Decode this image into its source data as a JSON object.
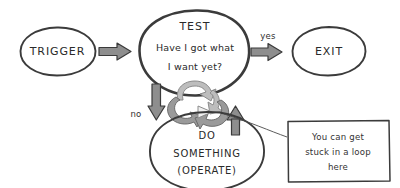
{
  "diagram": {
    "style": "hand-drawn sketch",
    "background_color": "#ffffff",
    "ink_color": "#3b3b3b",
    "arrow_fill_color": "#8e8e8e",
    "loop_arrow_color": "#9a9a9a"
  },
  "nodes": {
    "trigger": {
      "label": "TRIGGER",
      "shape": "ellipse"
    },
    "test": {
      "heading": "TEST",
      "line1": "Have I got what",
      "line2": "I want yet?",
      "shape": "ellipse"
    },
    "exit": {
      "label": "EXIT",
      "shape": "ellipse"
    },
    "operate": {
      "line1": "DO",
      "line2": "SOMETHING",
      "line3": "(OPERATE)",
      "shape": "ellipse"
    }
  },
  "edges": {
    "trigger_to_test": {
      "label": ""
    },
    "test_to_exit": {
      "label": "yes"
    },
    "test_to_operate": {
      "label": "no"
    },
    "operate_to_test": {
      "label": ""
    }
  },
  "loop_icon": {
    "name": "cyclic-loop-arrows",
    "description": "two curved arrows forming a cycle"
  },
  "callout": {
    "line1": "You can get",
    "line2": "stuck in a loop",
    "line3": "here"
  }
}
